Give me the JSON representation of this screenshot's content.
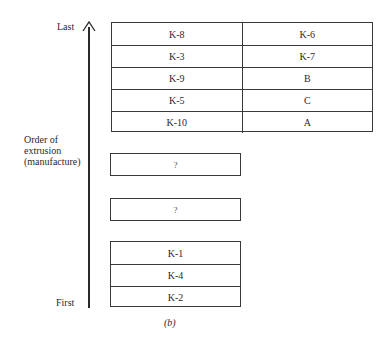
{
  "axis": {
    "top_label": "Last",
    "bottom_label": "First",
    "title_lines": [
      "Order of",
      "extrusion",
      "(manufacture)"
    ]
  },
  "top_table": {
    "rows": [
      [
        "K-8",
        "K-6"
      ],
      [
        "K-3",
        "K-7"
      ],
      [
        "K-9",
        "B"
      ],
      [
        "K-5",
        "C"
      ],
      [
        "K-10",
        "A"
      ]
    ]
  },
  "unknown_boxes": [
    "?",
    "?"
  ],
  "bottom_stack": [
    "K-1",
    "K-4",
    "K-2"
  ],
  "caption": "(b)"
}
